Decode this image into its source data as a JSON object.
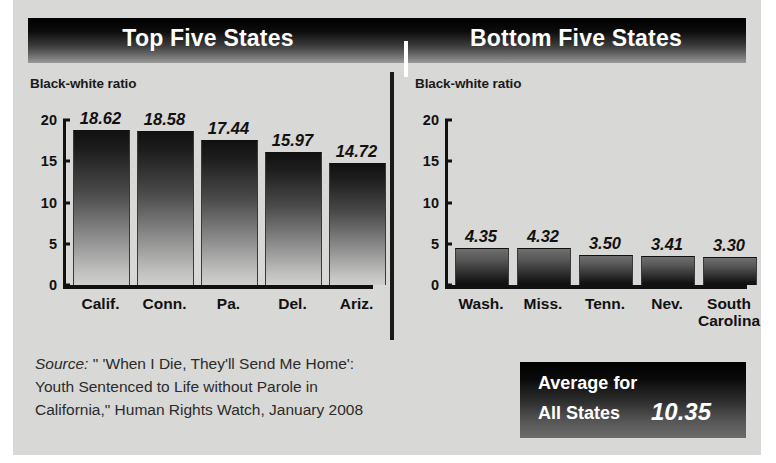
{
  "header": {
    "left_title": "Top Five States",
    "right_title": "Bottom Five States"
  },
  "axis_caption": "Black-white ratio",
  "source": {
    "label": "Source:",
    "line1": " \" 'When I Die, They'll Send Me Home':",
    "line2": "Youth Sentenced to Life without Parole in",
    "line3": "California,\" Human Rights Watch, January 2008"
  },
  "average": {
    "line1": "Average for",
    "line2": "All States",
    "value": "10.35"
  },
  "chart_data": [
    {
      "type": "bar",
      "title": "Top Five States",
      "ylabel": "Black-white ratio",
      "xlabel": "",
      "categories": [
        "Calif.",
        "Conn.",
        "Pa.",
        "Del.",
        "Ariz."
      ],
      "values": [
        18.62,
        18.58,
        17.44,
        15.97,
        14.72
      ],
      "value_labels": [
        "18.62",
        "18.58",
        "17.44",
        "15.97",
        "14.72"
      ],
      "ylim": [
        0,
        20
      ],
      "yticks": [
        0,
        5,
        10,
        15,
        20
      ],
      "ytick_labels": [
        "0",
        "5",
        "10",
        "15",
        "20"
      ],
      "grid": false,
      "legend": "none"
    },
    {
      "type": "bar",
      "title": "Bottom Five States",
      "ylabel": "Black-white ratio",
      "xlabel": "",
      "categories": [
        "Wash.",
        "Miss.",
        "Tenn.",
        "Nev.",
        "South Carolina"
      ],
      "values": [
        4.35,
        4.32,
        3.5,
        3.41,
        3.3
      ],
      "value_labels": [
        "4.35",
        "4.32",
        "3.50",
        "3.41",
        "3.30"
      ],
      "ylim": [
        0,
        20
      ],
      "yticks": [
        0,
        5,
        10,
        15,
        20
      ],
      "ytick_labels": [
        "0",
        "5",
        "10",
        "15",
        "20"
      ],
      "grid": false,
      "legend": "none"
    }
  ]
}
